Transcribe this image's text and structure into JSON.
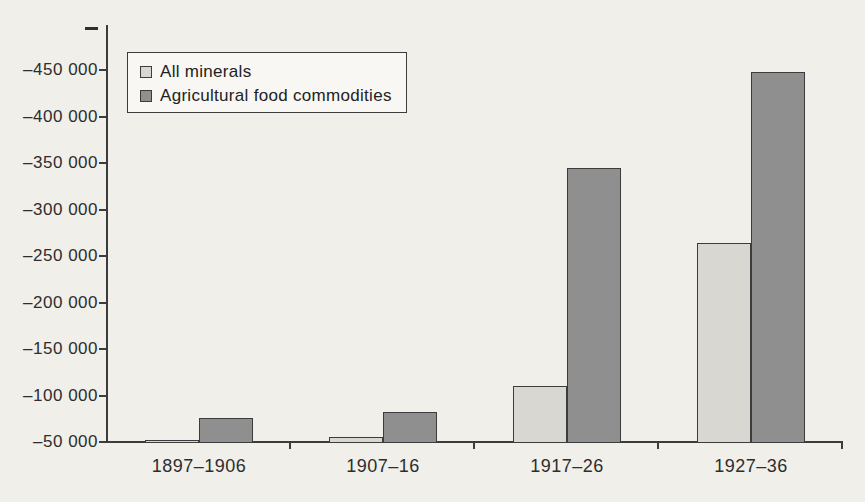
{
  "chart_data": {
    "type": "bar",
    "title": "",
    "xlabel": "",
    "ylabel": "",
    "grid": false,
    "legend_position": "upper-left",
    "categories": [
      "1897–1906",
      "1907–16",
      "1917–26",
      "1927–36"
    ],
    "series": [
      {
        "name": "All minerals",
        "color": "#d8d7d2",
        "values": [
          -52000,
          -55000,
          -110000,
          -264000
        ]
      },
      {
        "name": "Agricultural food commodities",
        "color": "#8f8f90",
        "values": [
          -76000,
          -82000,
          -345000,
          -448000
        ]
      }
    ],
    "y_axis": {
      "reversed": true,
      "baseline_value": -50000,
      "top_value": -500000,
      "tick_step": 50000,
      "top_partial_label": "–",
      "tick_values_top_to_bottom": [
        -450000,
        -400000,
        -350000,
        -300000,
        -250000,
        -200000,
        -150000,
        -100000,
        -50000
      ],
      "tick_labels_top_to_bottom": [
        "–450 000",
        "–400 000",
        "–350 000",
        "–300 000",
        "–250 000",
        "–200 000",
        "–150 000",
        "–100 000",
        "–50 000"
      ]
    }
  }
}
